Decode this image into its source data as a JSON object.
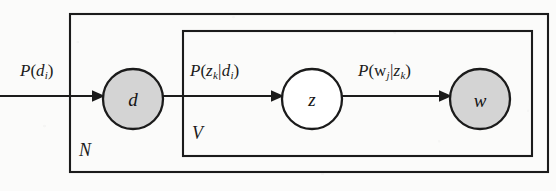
{
  "figure": {
    "type": "plate-diagram",
    "background_color": "#fbfbfa",
    "stroke_color": "#1b1b1b",
    "shaded_node_fill": "#d4d4d4",
    "unshaded_node_fill": "#ffffff"
  },
  "plates": [
    {
      "id": "outer",
      "label": "N",
      "x": 70,
      "y": 14,
      "width": 478,
      "height": 158
    },
    {
      "id": "inner",
      "label": "V",
      "x": 183,
      "y": 31,
      "width": 349,
      "height": 125
    }
  ],
  "nodes": [
    {
      "id": "d",
      "label": "d",
      "cx": 133,
      "cy": 99,
      "r": 30,
      "observed": true,
      "fill": "#d4d4d4"
    },
    {
      "id": "z",
      "label": "z",
      "cx": 312,
      "cy": 99,
      "r": 30,
      "observed": false,
      "fill": "#ffffff"
    },
    {
      "id": "w",
      "label": "w",
      "cx": 480,
      "cy": 99,
      "r": 30,
      "observed": true,
      "fill": "#d4d4d4"
    }
  ],
  "edges": [
    {
      "id": "prior-to-d",
      "from": "prior",
      "to": "d",
      "label_plain": "P(d_i)",
      "label_parts": {
        "p": "P",
        "open": "(",
        "var": "d",
        "sub": "i",
        "close": ")"
      },
      "label_x": 20,
      "label_y": 62
    },
    {
      "id": "d-to-z",
      "from": "d",
      "to": "z",
      "label_plain": "P(z_k|d_i)",
      "label_parts": {
        "p": "P",
        "open": "(",
        "var": "z",
        "sub": "k",
        "bar": "|",
        "var2": "d",
        "sub2": "i",
        "close": ")"
      },
      "label_x": 190,
      "label_y": 62
    },
    {
      "id": "z-to-w",
      "from": "z",
      "to": "w",
      "label_plain": "P(w_j|z_k)",
      "label_parts": {
        "p": "P",
        "open": "(",
        "var": "w",
        "sub": "j",
        "bar": "|",
        "var2": "z",
        "sub2": "k",
        "close": ")"
      },
      "label_x": 358,
      "label_y": 62
    }
  ],
  "plate_labels": [
    {
      "id": "outer-plate-label",
      "text": "N",
      "x": 79,
      "y": 141
    },
    {
      "id": "inner-plate-label",
      "text": "V",
      "x": 192,
      "y": 124
    }
  ],
  "ghost_marks": [
    {
      "text": "",
      "x": 8,
      "y": 22
    },
    {
      "text": "",
      "x": 104,
      "y": 30
    },
    {
      "text": "",
      "x": 238,
      "y": 28
    },
    {
      "text": "",
      "x": 6,
      "y": 150
    },
    {
      "text": "",
      "x": 120,
      "y": 156
    },
    {
      "text": "",
      "x": 300,
      "y": 158
    }
  ]
}
